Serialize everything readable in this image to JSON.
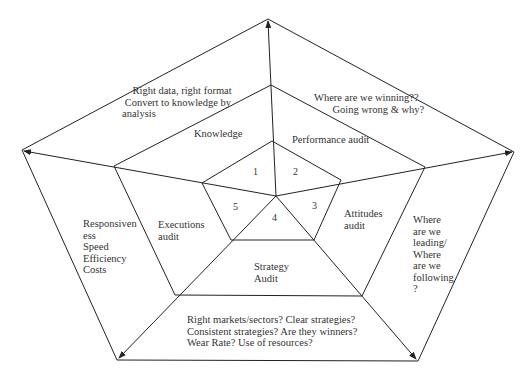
{
  "diagram": {
    "type": "nested-pentagon",
    "colors": {
      "line": "#222222",
      "text": "#333333",
      "background": "#ffffff"
    },
    "inner_segments": [
      "1",
      "2",
      "3",
      "4",
      "5"
    ],
    "middle_ring": {
      "knowledge": "Knowledge",
      "performance": "Performance audit",
      "attitudes": "Attitudes\naudit",
      "strategy": "Strategy\nAudit",
      "executions": "Executions\naudit"
    },
    "outer_ring": {
      "knowledge_q": "    Right data, right format\n Convert to knowledge by\nanalysis",
      "performance_q": "Where are we winning??\n       Going wrong & why?",
      "attitudes_q": "Where\nare we\nleading/\nWhere\nare we\nfollowing\n?",
      "strategy_q": "Right markets/sectors? Clear strategies?\nConsistent strategies? Are they winners?\nWear Rate? Use of resources?",
      "executions_q": "Responsiven\ness\nSpeed\nEfficiency\nCosts"
    }
  }
}
